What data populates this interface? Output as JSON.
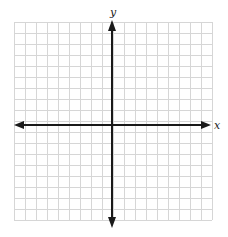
{
  "diagram": {
    "type": "coordinate-plane",
    "grid": {
      "columns": 18,
      "rows": 18,
      "cell_px": 11,
      "left": 14,
      "top": 22,
      "line_color": "#d6d6d6"
    },
    "origin_px": {
      "x": 112,
      "y": 125
    },
    "axes": {
      "color": "#1a1a1a",
      "x_label": "x",
      "y_label": "y",
      "x_arrows": "both",
      "y_arrows": "both"
    }
  }
}
